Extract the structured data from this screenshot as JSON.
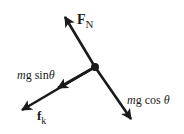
{
  "diagram": {
    "colors": {
      "ink": "#1a1a1a",
      "background": "#ffffff"
    },
    "center_point": {
      "x": 95,
      "y": 67
    },
    "forces": [
      {
        "id": "normal",
        "label_main": "F",
        "label_sub": "N",
        "tip": {
          "x": 64,
          "y": 15
        }
      },
      {
        "id": "gravity-parallel",
        "label_m": "m",
        "label_rest": "g sin",
        "label_theta": "θ",
        "tip": {
          "x": 57,
          "y": 88
        }
      },
      {
        "id": "friction",
        "label_main": "f",
        "label_sub": "k",
        "tip": {
          "x": 20,
          "y": 111
        }
      },
      {
        "id": "gravity-perpendicular",
        "label_m": "m",
        "label_rest": "g cos ",
        "label_theta": "θ",
        "tip": {
          "x": 132,
          "y": 121
        }
      }
    ]
  }
}
